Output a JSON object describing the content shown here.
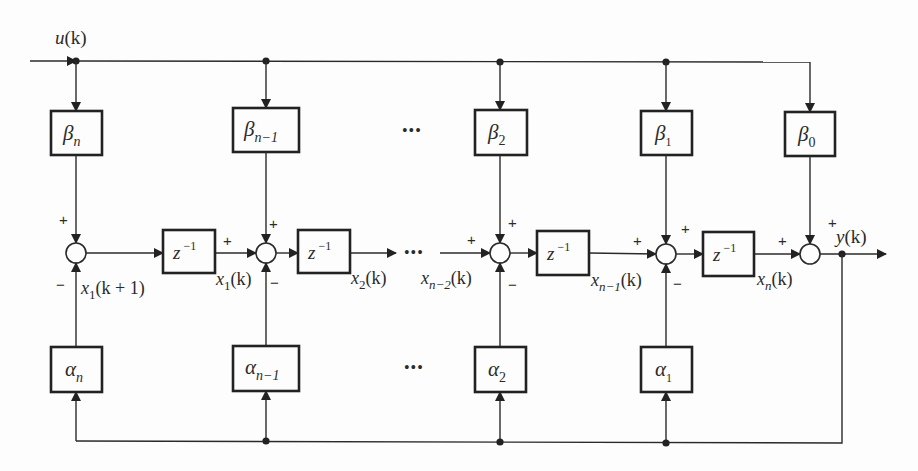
{
  "diagram": {
    "title": "",
    "input": {
      "label": "u",
      "arg": "(k)"
    },
    "output": {
      "label": "y",
      "arg": "(k)"
    },
    "delay": {
      "base": "z",
      "exp": "−1"
    },
    "ellipsis": "•••",
    "beta_blocks": [
      {
        "id": "beta-n",
        "symbol": "β",
        "sub": "n"
      },
      {
        "id": "beta-n-minus-1",
        "symbol": "β",
        "sub": "n−1"
      },
      {
        "id": "beta-2",
        "symbol": "β",
        "sub": "2"
      },
      {
        "id": "beta-1",
        "symbol": "β",
        "sub": "1"
      },
      {
        "id": "beta-0",
        "symbol": "β",
        "sub": "0"
      }
    ],
    "alpha_blocks": [
      {
        "id": "alpha-n",
        "symbol": "α",
        "sub": "n"
      },
      {
        "id": "alpha-n-minus-1",
        "symbol": "α",
        "sub": "n−1"
      },
      {
        "id": "alpha-2",
        "symbol": "α",
        "sub": "2"
      },
      {
        "id": "alpha-1",
        "symbol": "α",
        "sub": "1"
      }
    ],
    "state_labels": [
      {
        "id": "x1-k-plus-1",
        "var": "x",
        "sub": "1",
        "arg": "(k + 1)"
      },
      {
        "id": "x1-k",
        "var": "x",
        "sub": "1",
        "arg": "(k)"
      },
      {
        "id": "x2-k",
        "var": "x",
        "sub": "2",
        "arg": "(k)"
      },
      {
        "id": "xn-minus-2-k",
        "var": "x",
        "sub": "n−2",
        "arg": "(k)"
      },
      {
        "id": "xn-minus-1-k",
        "var": "x",
        "sub": "n−1",
        "arg": "(k)"
      },
      {
        "id": "xn-k",
        "var": "x",
        "sub": "n",
        "arg": "(k)"
      }
    ],
    "signs": {
      "plus": "+",
      "minus": "−"
    }
  }
}
